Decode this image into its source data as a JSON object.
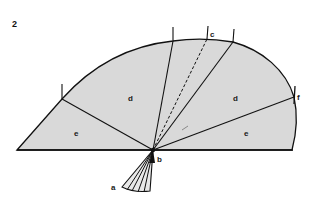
{
  "figure": {
    "number": "2",
    "colors": {
      "fill": "#d9d9d9",
      "stroke": "#111111",
      "background": "#ffffff"
    },
    "labels": {
      "a": "a",
      "b": "b",
      "c": "c",
      "d_left": "d",
      "d_right": "d",
      "e_left": "e",
      "e_right": "e",
      "f": "f"
    }
  }
}
